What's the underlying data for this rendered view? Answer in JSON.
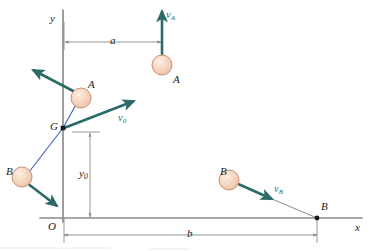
{
  "figure": {
    "background_color": "#ffffff"
  },
  "colors": {
    "axis": "#8c8c8c",
    "vector": "#2a6b68",
    "connector": "#3b5fc0",
    "ball_fill": "#f3d3bd",
    "ball_fill_light": "#fbe6d8",
    "ball_stroke": "#c98f73",
    "dimension": "#8a8a8a",
    "text": "#1a1a1a",
    "leader": "#6f6f6f"
  },
  "axes": {
    "x_axis_label": "x",
    "y_axis_label": "y",
    "origin_label": "O",
    "x_axis_y_px": 218,
    "y_axis_x_px": 63,
    "x_axis_start_px": 40,
    "x_axis_end_px": 362,
    "y_axis_top_px": 10,
    "y_axis_bottom_px": 222
  },
  "points": [
    {
      "name": "mass-center",
      "label": "G",
      "x": 63,
      "y": 128,
      "marker": "square-dot"
    },
    {
      "name": "particle-b-landing",
      "label": "B",
      "x": 317,
      "y": 218,
      "marker": "round-dot"
    }
  ],
  "balls": [
    {
      "name": "ball-a-at-g-frame",
      "label": "A",
      "cx": 81,
      "cy": 98,
      "r": 10,
      "label_x": 88,
      "label_y": 79
    },
    {
      "name": "ball-a-upper-right",
      "label": "A",
      "cx": 162,
      "cy": 65,
      "r": 10,
      "label_x": 173,
      "label_y": 74
    },
    {
      "name": "ball-b-lower-left",
      "label": "B",
      "cx": 22,
      "cy": 177,
      "r": 10,
      "label_x": 6,
      "label_y": 166
    },
    {
      "name": "ball-b-right",
      "label": "B",
      "cx": 229,
      "cy": 180,
      "r": 10,
      "label_x": 220,
      "label_y": 166
    }
  ],
  "vectors": [
    {
      "name": "velocity-a-upper-right",
      "label": "v",
      "subscript": "A",
      "x1": 162,
      "y1": 56,
      "x2": 162,
      "y2": 11,
      "label_x": 166,
      "label_y": 10
    },
    {
      "name": "velocity-a-from-ball-a",
      "label": "",
      "subscript": "",
      "x1": 77,
      "y1": 93,
      "x2": 33,
      "y2": 70,
      "label_x": 0,
      "label_y": 0
    },
    {
      "name": "velocity-nought-from-g",
      "label": "v",
      "subscript": "0",
      "x1": 64,
      "y1": 128,
      "x2": 134,
      "y2": 101,
      "label_x": 118,
      "label_y": 113
    },
    {
      "name": "velocity-b-from-ball-b-left",
      "label": "",
      "subscript": "",
      "x1": 27,
      "y1": 183,
      "x2": 57,
      "y2": 206,
      "label_x": 0,
      "label_y": 0
    },
    {
      "name": "velocity-b-right",
      "label": "v",
      "subscript": "B",
      "x1": 236,
      "y1": 183,
      "x2": 272,
      "y2": 199,
      "label_x": 274,
      "label_y": 184
    }
  ],
  "connectors": [
    {
      "name": "connector-g-to-ball-a",
      "x1": 63,
      "y1": 128,
      "x2": 78,
      "y2": 101
    },
    {
      "name": "connector-g-to-ball-b",
      "x1": 63,
      "y1": 128,
      "x2": 29,
      "y2": 172
    }
  ],
  "leaders": [
    {
      "name": "leader-vb-to-point-b",
      "x1": 272,
      "y1": 199,
      "x2": 317,
      "y2": 218
    }
  ],
  "dimensions": [
    {
      "name": "dimension-a",
      "label": "a",
      "orientation": "horizontal",
      "x1": 65,
      "x2": 161,
      "y": 42,
      "label_x": 110,
      "label_y": 35
    },
    {
      "name": "dimension-b",
      "label": "b",
      "orientation": "horizontal",
      "x1": 64,
      "x2": 317,
      "y": 235,
      "label_x": 187,
      "label_y": 228
    },
    {
      "name": "dimension-y-nought",
      "label": "y",
      "sublabel": "0",
      "orientation": "vertical",
      "x": 90,
      "y1": 133,
      "y2": 217,
      "label_x": 79,
      "label_y": 168
    }
  ],
  "extension_lines": [
    {
      "name": "extension-line-y0-top",
      "x1": 72,
      "y1": 132,
      "x2": 100,
      "y2": 132
    },
    {
      "name": "extension-line-b-origin",
      "x1": 64,
      "y1": 219,
      "x2": 64,
      "y2": 243
    },
    {
      "name": "extension-line-b-end",
      "x1": 317,
      "y1": 219,
      "x2": 317,
      "y2": 243
    },
    {
      "name": "extension-line-a-yaxis",
      "x1": 64,
      "y1": 22,
      "x2": 64,
      "y2": 50
    }
  ]
}
